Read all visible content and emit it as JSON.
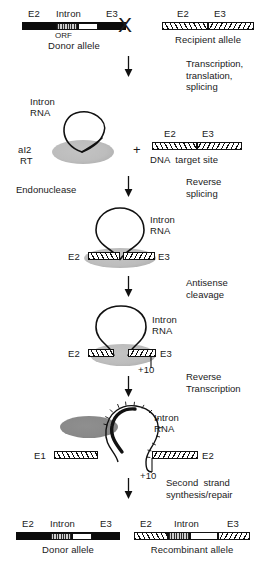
{
  "figure": {
    "title_alt": "Group II intron retrohoming pathway",
    "cross_symbol": "X",
    "plus_symbol": "+"
  },
  "colors": {
    "ink": "#111111",
    "exon_black": "#0b0b0b",
    "protein_gray": "#b9b9b9",
    "protein_dark_gray": "#8f8f8f",
    "background": "#ffffff"
  },
  "top": {
    "donor": {
      "exon_left": "E2",
      "intron": "Intron",
      "exon_right": "E3",
      "orf": "ORF",
      "caption": "Donor allele"
    },
    "recipient": {
      "exon_left": "E2",
      "exon_right": "E3",
      "caption": "Recipient allele"
    }
  },
  "steps": {
    "transcription": "Transcription,\ntranslation,\nsplicing",
    "reverse_splicing": "Reverse\nsplicing",
    "endonuclease": "Endonuclease",
    "antisense_cleavage": "Antisense\ncleavage",
    "reverse_transcription": "Reverse\nTranscription",
    "second_strand": "Second  strand\nsynthesis/repair"
  },
  "rnp": {
    "intron_rna": "Intron\nRNA",
    "protein_line1": "aI2",
    "protein_line2": "RT"
  },
  "target": {
    "exon_left": "E2",
    "exon_right": "E3",
    "caption": "DNA  target site"
  },
  "stage_reverse_splice": {
    "intron_rna": "Intron\nRNA",
    "exon_left": "E2",
    "exon_right": "E3"
  },
  "stage_antisense": {
    "intron_rna": "Intron\nRNA",
    "exon_left": "E2",
    "exon_right": "E3",
    "cleavage_site": "+10"
  },
  "stage_rt": {
    "intron_rna": "Intron\nRNA",
    "exon_left": "E1",
    "exon_right": "E2",
    "cleavage_site": "+10"
  },
  "bottom": {
    "donor": {
      "exon_left": "E2",
      "intron": "Intron",
      "exon_right": "E3",
      "orf": "ORF",
      "caption": "Donor allele"
    },
    "recombinant": {
      "exon_left": "E2",
      "intron": "Intron",
      "exon_right": "E3",
      "orf": "ORF",
      "caption": "Recombinant allele"
    }
  }
}
